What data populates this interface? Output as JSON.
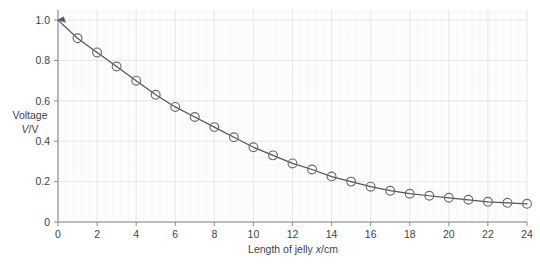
{
  "chart_data": {
    "type": "line",
    "title": "",
    "subtitle": "",
    "xlabel": "Length of jelly x/cm",
    "xlabel_parts": {
      "prefix": "Length of jelly ",
      "italic": "x",
      "suffix": "/cm"
    },
    "ylabel": "Voltage V/V",
    "ylabel_line1": "Voltage",
    "ylabel_line2_italic": "V",
    "ylabel_line2_suffix": "/V",
    "xlim": [
      0,
      24
    ],
    "ylim": [
      0,
      1.05
    ],
    "xticks": [
      0,
      2,
      4,
      6,
      8,
      10,
      12,
      14,
      16,
      18,
      20,
      22,
      24
    ],
    "xtick_labels": [
      "0",
      "2",
      "4",
      "6",
      "8",
      "10",
      "12",
      "14",
      "16",
      "18",
      "20",
      "22",
      "24"
    ],
    "yticks": [
      0,
      0.2,
      0.4,
      0.6,
      0.8,
      1.0
    ],
    "ytick_labels": [
      "0",
      "0.2",
      "0.4",
      "0.6",
      "0.8",
      "1.0"
    ],
    "grid": true,
    "grid_major_step_x": 2,
    "grid_major_step_y": 0.2,
    "grid_minor_divisions": 5,
    "legend": null,
    "legend_position": "none",
    "marker": "circle",
    "marker_size": 4.4,
    "line_color": "#55555a",
    "marker_edge_color": "#6b6b70",
    "marker_face_color": "#ffffff",
    "grid_major_color": "#e4e7ea",
    "grid_minor_color": "#f1f3f5",
    "axis_color": "#8a8a90",
    "text_color": "#3f3f46",
    "x": [
      0,
      1,
      2,
      3,
      4,
      5,
      6,
      7,
      8,
      9,
      10,
      11,
      12,
      13,
      14,
      15,
      16,
      17,
      18,
      19,
      20,
      21,
      22,
      23,
      24
    ],
    "y": [
      1.0,
      0.91,
      0.84,
      0.77,
      0.7,
      0.63,
      0.57,
      0.52,
      0.47,
      0.42,
      0.37,
      0.33,
      0.29,
      0.26,
      0.225,
      0.2,
      0.175,
      0.155,
      0.14,
      0.13,
      0.12,
      0.11,
      0.1,
      0.095,
      0.09
    ],
    "marker_x": [
      1,
      2,
      3,
      4,
      5,
      6,
      7,
      8,
      9,
      10,
      11,
      12,
      13,
      14,
      15,
      16,
      17,
      18,
      19,
      20,
      21,
      22,
      23,
      24
    ],
    "marker_y": [
      0.91,
      0.84,
      0.77,
      0.7,
      0.63,
      0.57,
      0.52,
      0.47,
      0.42,
      0.37,
      0.33,
      0.29,
      0.26,
      0.225,
      0.2,
      0.175,
      0.155,
      0.14,
      0.13,
      0.12,
      0.11,
      0.1,
      0.095,
      0.09
    ],
    "has_arrow_start": true,
    "series": [
      {
        "name": "Voltage across jelly",
        "x": [
          0,
          1,
          2,
          3,
          4,
          5,
          6,
          7,
          8,
          9,
          10,
          11,
          12,
          13,
          14,
          15,
          16,
          17,
          18,
          19,
          20,
          21,
          22,
          23,
          24
        ],
        "values": [
          1.0,
          0.91,
          0.84,
          0.77,
          0.7,
          0.63,
          0.57,
          0.52,
          0.47,
          0.42,
          0.37,
          0.33,
          0.29,
          0.26,
          0.225,
          0.2,
          0.175,
          0.155,
          0.14,
          0.13,
          0.12,
          0.11,
          0.1,
          0.095,
          0.09
        ]
      }
    ]
  }
}
